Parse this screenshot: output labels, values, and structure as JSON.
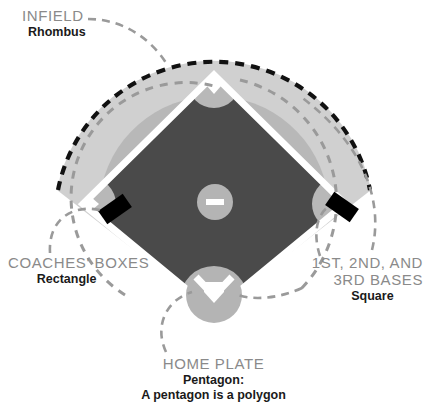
{
  "diagram": {
    "type": "baseball-field-shapes-diagram",
    "background_color": "#ffffff"
  },
  "colors": {
    "outfield_outer": "#d0d0d0",
    "outfield_inner": "#b8b8b8",
    "infield_dirt": "#4a4a4a",
    "base_path_line": "#ffffff",
    "circle_gray": "#b4b4b4",
    "marker_black": "#000000",
    "leader_line": "#9a9a9a",
    "outfield_border": "#111111",
    "label_title": "#8a8a8a",
    "label_sub": "#1a1a1a"
  },
  "labels": {
    "infield": {
      "title": "INFIELD",
      "subtitle": "Rhombus"
    },
    "coaches_boxes": {
      "title": "COACHES' BOXES",
      "subtitle": "Rectangle"
    },
    "bases": {
      "title_line1": "1ST, 2ND, AND",
      "title_line2": "3RD BASES",
      "subtitle": "Square"
    },
    "home_plate": {
      "title": "HOME PLATE",
      "subtitle_line1": "Pentagon:",
      "subtitle_line2": "A pentagon is a polygon"
    }
  },
  "field_parts": {
    "outfield_arc": "outfield-arc",
    "infield_diamond": "infield-diamond",
    "pitchers_mound": "pitchers-mound",
    "pitchers_rubber": "pitchers-rubber",
    "home_plate_circle": "home-plate-circle",
    "home_plate_shape": "home-plate-shape",
    "second_base": "second-base",
    "first_base": "first-base",
    "third_base": "third-base",
    "coaches_box_left": "coaches-box-left",
    "coaches_box_right": "coaches-box-right"
  }
}
